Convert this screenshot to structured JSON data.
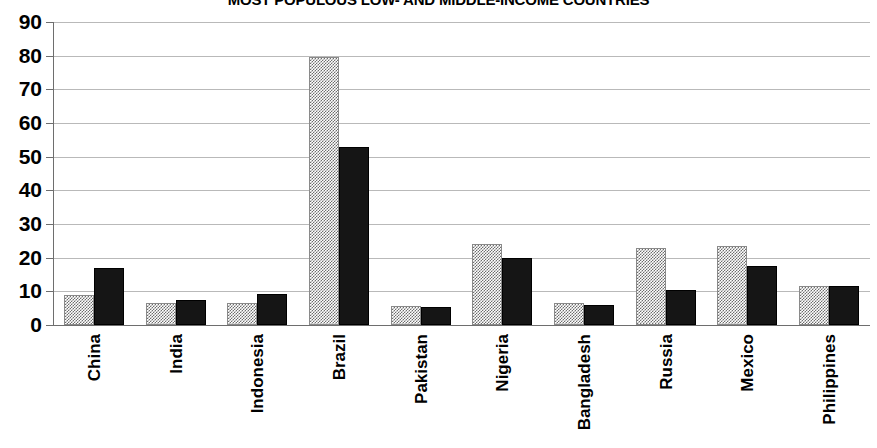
{
  "chart_data": {
    "type": "bar",
    "title": "MOST POPULOUS LOW- AND MIDDLE-INCOME COUNTRIES",
    "xlabel": "",
    "ylabel": "",
    "ylim": [
      0,
      90
    ],
    "ytick_step": 10,
    "yticks": [
      "90",
      "80",
      "70",
      "60",
      "50",
      "40",
      "30",
      "20",
      "10",
      "0"
    ],
    "grid": true,
    "legend": "none",
    "categories": [
      "China",
      "India",
      "Indonesia",
      "Brazil",
      "Pakistan",
      "Nigeria",
      "Bangladesh",
      "Russia",
      "Mexico",
      "Philippines"
    ],
    "series": [
      {
        "name": "series-1",
        "style": "gray-hatch",
        "color": "#6d6d6d",
        "values": [
          9,
          6.5,
          6.5,
          79.5,
          5.5,
          24,
          6.5,
          23,
          23.5,
          11.5
        ]
      },
      {
        "name": "series-2",
        "style": "solid-black",
        "color": "#151515",
        "values": [
          17,
          7.5,
          9.3,
          53,
          5.3,
          20,
          6,
          10.5,
          17.5,
          11.7
        ]
      }
    ]
  }
}
